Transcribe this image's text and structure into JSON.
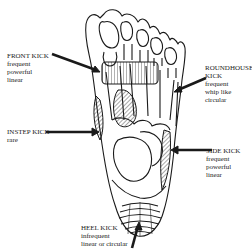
{
  "diagram": {
    "labels": {
      "front_kick": {
        "title": "FRONT KICK",
        "lines": [
          "frequent",
          "powerful",
          "linear"
        ]
      },
      "roundhouse_kick": {
        "title1": "ROUNDHOUSE",
        "title2": "KICK",
        "lines": [
          "frequent",
          "whip like",
          "circular"
        ]
      },
      "instep_kick": {
        "title": "INSTEP KICK",
        "lines": [
          "rare"
        ]
      },
      "side_kick": {
        "title": "SIDE KICK",
        "lines": [
          "frequent",
          "powerful",
          "linear"
        ]
      },
      "heel_kick": {
        "title": "HEEL KICK",
        "lines": [
          "infrequent",
          "linear or circular"
        ]
      }
    },
    "colors": {
      "line": "#1a1a1a",
      "background": "#ffffff"
    }
  }
}
